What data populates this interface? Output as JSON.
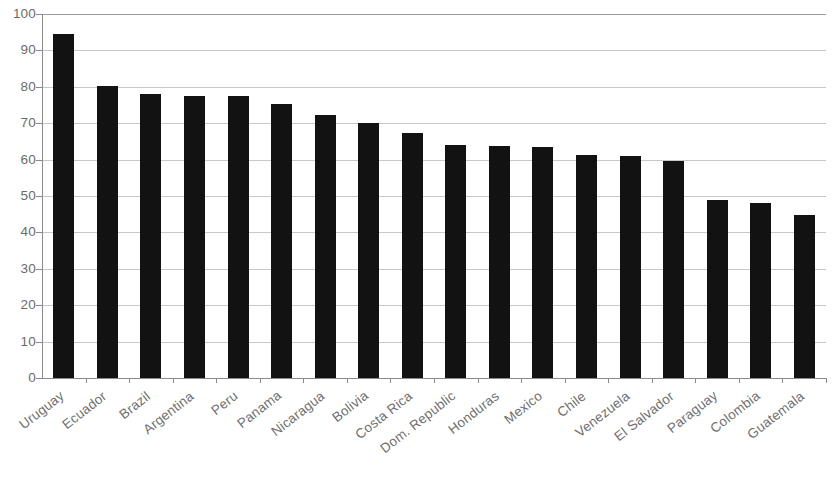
{
  "chart_data": {
    "type": "bar",
    "title": "",
    "subtitle": "",
    "xlabel": "",
    "ylabel": "",
    "ylim": [
      0,
      100
    ],
    "ytick_step": 10,
    "yticks": [
      0,
      10,
      20,
      30,
      40,
      50,
      60,
      70,
      80,
      90,
      100
    ],
    "grid": true,
    "grid_axis": "y",
    "legend": null,
    "bar_color": "#121212",
    "axis_text_color": "#6b6b6b",
    "gridline_color": "#c8c8c8",
    "categories": [
      "Uruguay",
      "Ecuador",
      "Brazil",
      "Argentina",
      "Peru",
      "Panama",
      "Nicaragua",
      "Bolivia",
      "Costa Rica",
      "Dom. Republic",
      "Honduras",
      "Mexico",
      "Chile",
      "Venezuela",
      "El Salvador",
      "Paraguay",
      "Colombia",
      "Guatemala"
    ],
    "values": [
      94.5,
      80.3,
      78.0,
      77.6,
      77.5,
      75.3,
      72.2,
      70.0,
      67.4,
      64.0,
      63.7,
      63.6,
      61.4,
      61.0,
      59.7,
      48.8,
      48.0,
      44.7
    ]
  }
}
